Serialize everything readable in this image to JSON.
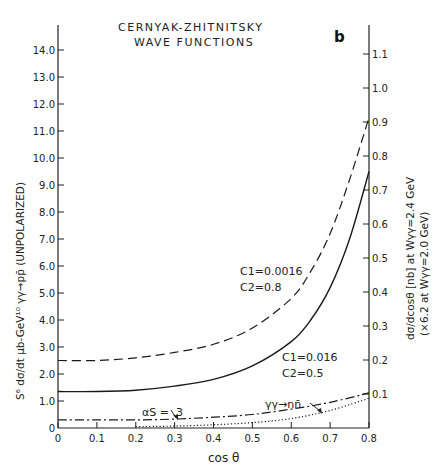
{
  "chart_data": {
    "type": "line",
    "title": "CERNYAK-ZHITNITSKY",
    "subtitle": "WAVE FUNCTIONS",
    "panel_label": "b",
    "xlabel": "cos θ",
    "ylabel": "S⁶ dσ/dt μb-GeV¹⁰  γγ→pp̄ (UNPOLARIZED)",
    "ylabel_right": "dσ/dcosθ [nb] at Wγγ=2.4 GeV",
    "ylabel_right2": "(×6.2 at Wγγ=2.0 GeV)",
    "xlim": [
      0,
      0.8
    ],
    "ylim": [
      0,
      14.0
    ],
    "ylim_right": [
      0,
      1.12
    ],
    "grid": false,
    "x_ticks": [
      "0",
      "0.1",
      "0.2",
      "0.3",
      "0.4",
      "0.5",
      "0.6",
      "0.7",
      "0.8"
    ],
    "y_ticks": [
      "0",
      "1.0",
      "2.0",
      "3.0",
      "4.0",
      "5.0",
      "6.0",
      "7.0",
      "8.0",
      "9.0",
      "10.0",
      "11.0",
      "12.0",
      "13.0",
      "14.0"
    ],
    "y_ticks_right": [
      "0.1",
      "0.2",
      "0.3",
      "0.4",
      "0.5",
      "0.6",
      "0.7",
      "0.8",
      "0.9",
      "1.0",
      "1.1"
    ],
    "series": [
      {
        "name": "C1=0.0016, C2=0.8",
        "label_line1": "C1=0.0016",
        "label_line2": "C2=0.8",
        "style": "dashed",
        "x": [
          0,
          0.1,
          0.2,
          0.3,
          0.4,
          0.5,
          0.6,
          0.65,
          0.7,
          0.75,
          0.8
        ],
        "y": [
          2.5,
          2.5,
          2.6,
          2.8,
          3.1,
          3.7,
          4.8,
          5.8,
          7.2,
          9.2,
          11.5
        ]
      },
      {
        "name": "C1=0.016, C2=0.5",
        "label_line1": "C1=0.016",
        "label_line2": "C2=0.5",
        "style": "solid",
        "x": [
          0,
          0.1,
          0.2,
          0.3,
          0.4,
          0.5,
          0.6,
          0.65,
          0.7,
          0.75,
          0.8
        ],
        "y": [
          1.35,
          1.35,
          1.4,
          1.55,
          1.8,
          2.3,
          3.2,
          4.0,
          5.2,
          7.0,
          9.5
        ]
      },
      {
        "name": "αs=.3 (γγ→pp̄)",
        "label_line1": "αS = .3",
        "style": "dashdot",
        "x": [
          0,
          0.1,
          0.2,
          0.3,
          0.4,
          0.5,
          0.6,
          0.7,
          0.8
        ],
        "y": [
          0.3,
          0.3,
          0.3,
          0.33,
          0.4,
          0.5,
          0.7,
          0.95,
          1.3
        ]
      },
      {
        "name": "γγ→nn̄",
        "label_line1": "γγ→nn̄",
        "style": "dotted",
        "x": [
          0.2,
          0.3,
          0.4,
          0.5,
          0.6,
          0.7,
          0.8
        ],
        "y": [
          0.05,
          0.07,
          0.12,
          0.2,
          0.35,
          0.65,
          1.1
        ]
      }
    ]
  }
}
